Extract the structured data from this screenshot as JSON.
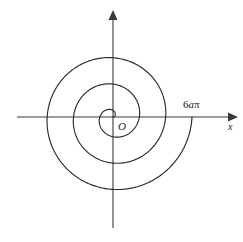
{
  "figure": {
    "background_color": "#ffffff",
    "curve_color": "#2b2b2b",
    "axis_color": "#3a3a3a",
    "origin_label": "O",
    "x_axis_label": "x",
    "endpoint_label_prefix": "6",
    "endpoint_label_variable": "a",
    "endpoint_label_suffix": "π"
  },
  "chart_data": {
    "type": "line",
    "title": "",
    "subtitle": "",
    "xlabel": "x",
    "ylabel": "",
    "grid": false,
    "legend": null,
    "curve_name": "Archimedean spiral r = aθ",
    "polar_equation": "r = aθ",
    "theta_start": 0,
    "theta_end": 18.8495559,
    "turns": 3,
    "annotations": [
      {
        "text": "O",
        "x": 0,
        "y": 0,
        "role": "origin"
      },
      {
        "text": "6aπ",
        "x": 18.8495559,
        "y": 0,
        "role": "spiral-endpoint"
      },
      {
        "text": "x",
        "x": 1,
        "y": 0,
        "role": "axis-label"
      }
    ],
    "axis_crossings_positive_x": [
      2.0944,
      6.2832,
      12.5664,
      18.8496
    ],
    "axis_crossings_negative_x": [
      3.1416,
      9.4248,
      15.708
    ],
    "xlim": [
      -21,
      21
    ],
    "ylim": [
      -21,
      21
    ]
  }
}
